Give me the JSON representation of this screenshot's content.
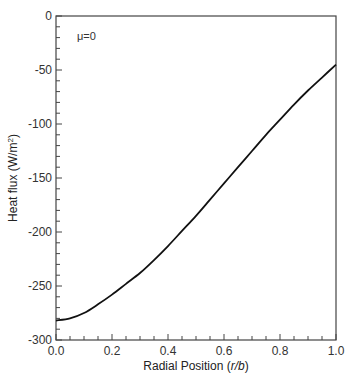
{
  "chart_data": {
    "type": "line",
    "title": "",
    "xlabel": "Radial Position (r/b)",
    "xlabel_parts": {
      "prefix": "Radial Position (",
      "italic": "r/b",
      "suffix": ")"
    },
    "ylabel": "Heat flux (W/m²)",
    "ylabel_parts": {
      "prefix": "Heat flux (W/m",
      "sup": "2",
      "suffix": ")"
    },
    "xlim": [
      0.0,
      1.0
    ],
    "ylim": [
      -300,
      0
    ],
    "xticks": [
      "0.0",
      "0.2",
      "0.4",
      "0.6",
      "0.8",
      "1.0"
    ],
    "yticks": [
      "0",
      "-50",
      "-100",
      "-150",
      "-200",
      "-250",
      "-300"
    ],
    "grid": false,
    "legend": null,
    "annotations": [
      {
        "text": "μ=0",
        "x": 0.075,
        "y": -20
      }
    ],
    "series": [
      {
        "name": "μ=0",
        "color": "#111111",
        "x": [
          0.0,
          0.05,
          0.1,
          0.15,
          0.2,
          0.25,
          0.3,
          0.35,
          0.4,
          0.45,
          0.5,
          0.55,
          0.6,
          0.65,
          0.7,
          0.75,
          0.8,
          0.85,
          0.9,
          0.95,
          1.0
        ],
        "y": [
          -282,
          -280,
          -275,
          -267,
          -258,
          -248,
          -238,
          -226,
          -213,
          -199,
          -185,
          -170,
          -155,
          -140,
          -125,
          -110,
          -96,
          -82,
          -69,
          -57,
          -45
        ]
      }
    ]
  }
}
